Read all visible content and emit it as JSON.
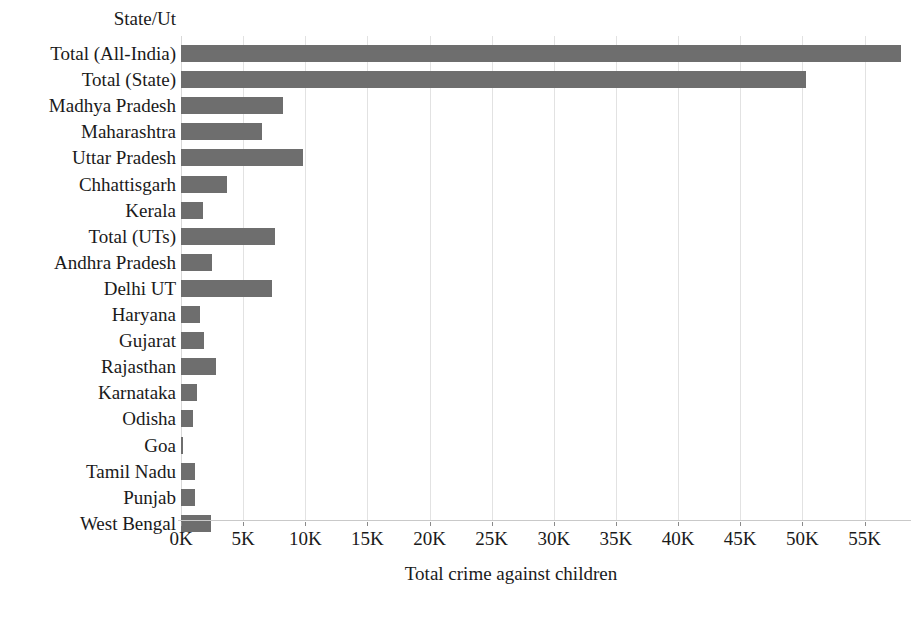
{
  "chart_data": {
    "type": "bar",
    "orientation": "horizontal",
    "title": "",
    "category_axis_header": "State/Ut",
    "xlabel": "Total crime against children",
    "ylabel": "State/Ut",
    "xlim": [
      0,
      58500
    ],
    "xticks": [
      0,
      5000,
      10000,
      15000,
      20000,
      25000,
      30000,
      35000,
      40000,
      45000,
      50000,
      55000
    ],
    "xtick_labels": [
      "0K",
      "5K",
      "10K",
      "15K",
      "20K",
      "25K",
      "30K",
      "35K",
      "40K",
      "45K",
      "50K",
      "55K"
    ],
    "grid": "vertical-only",
    "legend": "none",
    "bar_color": "#6e6e6e",
    "categories": [
      "Total (All-India)",
      "Total (State)",
      "Madhya Pradesh",
      "Maharashtra",
      "Uttar Pradesh",
      "Chhattisgarh",
      "Kerala",
      "Total (UTs)",
      "Andhra Pradesh",
      "Delhi UT",
      "Haryana",
      "Gujarat",
      "Rajasthan",
      "Karnataka",
      "Odisha",
      "Goa",
      "Tamil Nadu",
      "Punjab",
      "West Bengal"
    ],
    "values": [
      57900,
      50300,
      8200,
      6500,
      9800,
      3700,
      1800,
      7600,
      2500,
      7300,
      1500,
      1850,
      2850,
      1250,
      950,
      150,
      1150,
      1150,
      2450
    ]
  }
}
